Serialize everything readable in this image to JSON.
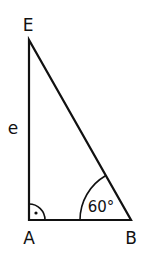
{
  "diagram": {
    "type": "right-triangle",
    "vertices": {
      "E": {
        "label": "E"
      },
      "A": {
        "label": "A"
      },
      "B": {
        "label": "B"
      }
    },
    "side_label": "e",
    "angle_B": "60°",
    "right_angle_at": "A",
    "stroke_color": "#111111"
  }
}
